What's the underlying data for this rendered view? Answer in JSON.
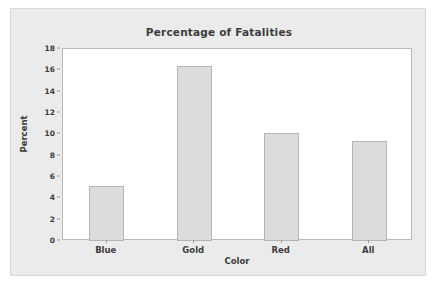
{
  "chart_data": {
    "type": "bar",
    "title": "Percentage of Fatalities",
    "xlabel": "Color",
    "ylabel": "Percent",
    "categories": [
      "Blue",
      "Gold",
      "Red",
      "All"
    ],
    "values": [
      5.2,
      16.4,
      10.1,
      9.4
    ],
    "ylim": [
      0,
      18
    ],
    "ytick_labels": [
      "0",
      "2",
      "4",
      "6",
      "8",
      "10",
      "12",
      "14",
      "16",
      "18"
    ],
    "ytick_values": [
      0,
      2,
      4,
      6,
      8,
      10,
      12,
      14,
      16,
      18
    ],
    "grid": false,
    "legend": null,
    "bar_fill_color": "#dcdcdc",
    "bar_border_color": "#b4b4b4",
    "panel_color": "#ebebeb",
    "plot_background": "#ffffff",
    "text_color": "#3c3c3c"
  }
}
